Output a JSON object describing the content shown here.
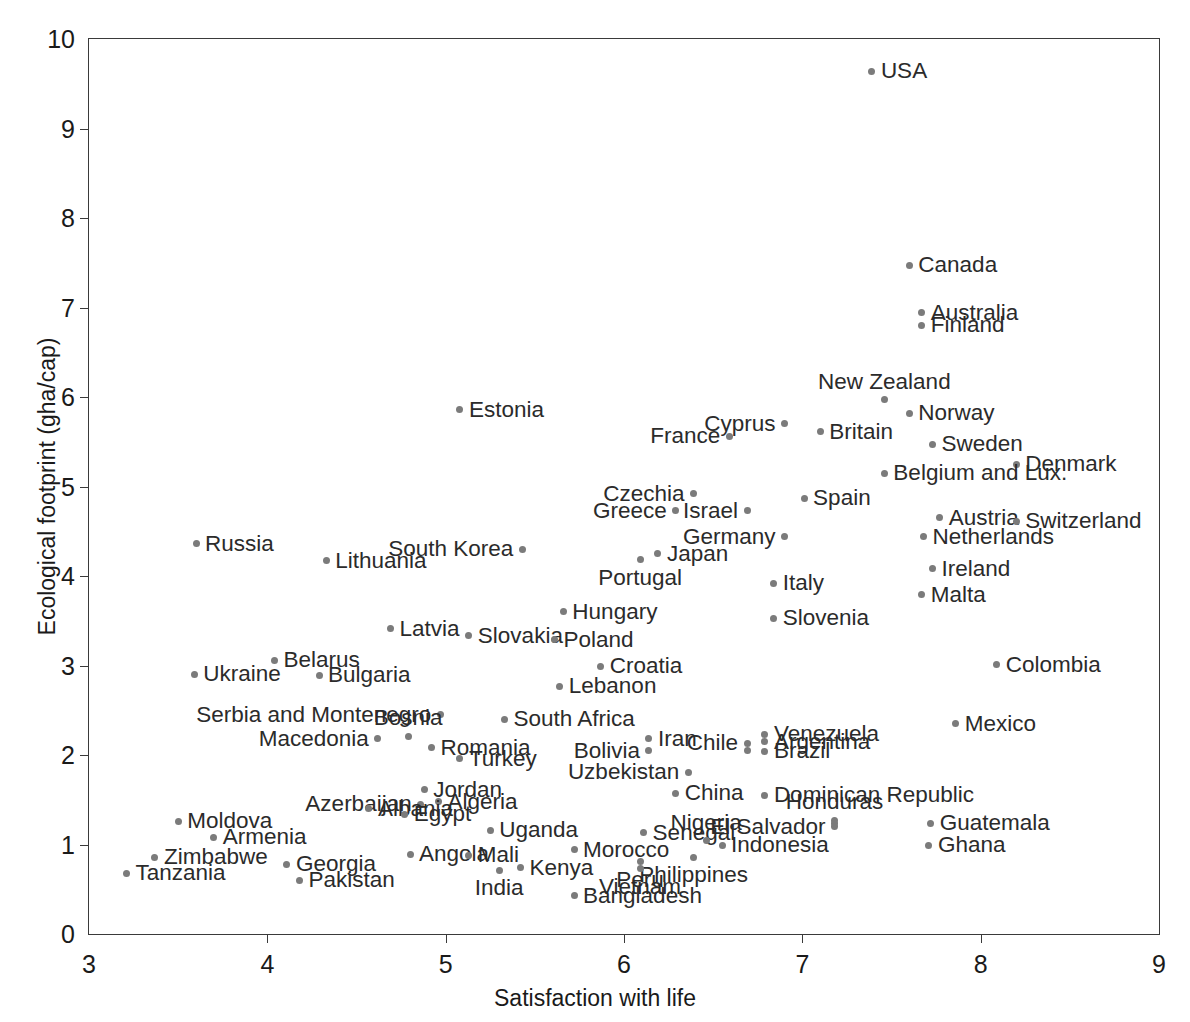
{
  "chart_data": {
    "type": "scatter",
    "title": "",
    "xlabel": "Satisfaction with life",
    "ylabel": "Ecological footprint (gha/cap)",
    "xlim": [
      3,
      9
    ],
    "ylim": [
      0,
      10
    ],
    "xticks": [
      3,
      4,
      5,
      6,
      7,
      8,
      9
    ],
    "yticks": [
      0,
      1,
      2,
      3,
      4,
      5,
      6,
      7,
      8,
      9,
      10
    ],
    "grid": false,
    "legend": null,
    "point_color": "#7b7b7b",
    "axis_color": "#3a3a3a",
    "points": [
      {
        "label": "USA",
        "x": 7.39,
        "y": 9.64,
        "anchor": "right"
      },
      {
        "label": "Canada",
        "x": 7.6,
        "y": 7.47,
        "anchor": "right"
      },
      {
        "label": "Australia",
        "x": 7.67,
        "y": 6.94,
        "anchor": "right"
      },
      {
        "label": "Finland",
        "x": 7.67,
        "y": 6.8,
        "anchor": "right"
      },
      {
        "label": "New Zealand",
        "x": 7.46,
        "y": 5.97,
        "anchor": "above"
      },
      {
        "label": "Estonia",
        "x": 5.08,
        "y": 5.86,
        "anchor": "right"
      },
      {
        "label": "Norway",
        "x": 7.6,
        "y": 5.82,
        "anchor": "right"
      },
      {
        "label": "Cyprus",
        "x": 6.9,
        "y": 5.7,
        "anchor": "left"
      },
      {
        "label": "Britain",
        "x": 7.1,
        "y": 5.61,
        "anchor": "right"
      },
      {
        "label": "France",
        "x": 6.59,
        "y": 5.56,
        "anchor": "left"
      },
      {
        "label": "Sweden",
        "x": 7.73,
        "y": 5.47,
        "anchor": "right"
      },
      {
        "label": "Denmark",
        "x": 8.2,
        "y": 5.25,
        "anchor": "right"
      },
      {
        "label": "Belgium and Lux.",
        "x": 7.46,
        "y": 5.15,
        "anchor": "right"
      },
      {
        "label": "Czechia",
        "x": 6.39,
        "y": 4.92,
        "anchor": "left"
      },
      {
        "label": "Spain",
        "x": 7.01,
        "y": 4.87,
        "anchor": "right"
      },
      {
        "label": "Israel",
        "x": 6.69,
        "y": 4.73,
        "anchor": "left"
      },
      {
        "label": "Greece",
        "x": 6.29,
        "y": 4.73,
        "anchor": "left"
      },
      {
        "label": "Austria",
        "x": 7.77,
        "y": 4.65,
        "anchor": "right"
      },
      {
        "label": "Switzerland",
        "x": 8.2,
        "y": 4.61,
        "anchor": "right"
      },
      {
        "label": "Germany",
        "x": 6.9,
        "y": 4.44,
        "anchor": "left"
      },
      {
        "label": "Netherlands",
        "x": 7.68,
        "y": 4.44,
        "anchor": "right"
      },
      {
        "label": "Russia",
        "x": 3.6,
        "y": 4.36,
        "anchor": "right"
      },
      {
        "label": "South Korea",
        "x": 5.43,
        "y": 4.3,
        "anchor": "left"
      },
      {
        "label": "Japan",
        "x": 6.19,
        "y": 4.25,
        "anchor": "right"
      },
      {
        "label": "Portugal",
        "x": 6.09,
        "y": 4.18,
        "anchor": "below"
      },
      {
        "label": "Lithuania",
        "x": 4.33,
        "y": 4.17,
        "anchor": "right"
      },
      {
        "label": "Ireland",
        "x": 7.73,
        "y": 4.08,
        "anchor": "right"
      },
      {
        "label": "Italy",
        "x": 6.84,
        "y": 3.92,
        "anchor": "right"
      },
      {
        "label": "Malta",
        "x": 7.67,
        "y": 3.79,
        "anchor": "right"
      },
      {
        "label": "Hungary",
        "x": 5.66,
        "y": 3.6,
        "anchor": "right"
      },
      {
        "label": "Slovenia",
        "x": 6.84,
        "y": 3.53,
        "anchor": "right"
      },
      {
        "label": "Latvia",
        "x": 4.69,
        "y": 3.41,
        "anchor": "right"
      },
      {
        "label": "Slovakia",
        "x": 5.13,
        "y": 3.33,
        "anchor": "right"
      },
      {
        "label": "Poland",
        "x": 5.61,
        "y": 3.29,
        "anchor": "right"
      },
      {
        "label": "Belarus",
        "x": 4.04,
        "y": 3.06,
        "anchor": "right"
      },
      {
        "label": "Colombia",
        "x": 8.09,
        "y": 3.01,
        "anchor": "right"
      },
      {
        "label": "Croatia",
        "x": 5.87,
        "y": 2.99,
        "anchor": "right"
      },
      {
        "label": "Ukraine",
        "x": 3.59,
        "y": 2.9,
        "anchor": "right"
      },
      {
        "label": "Bulgaria",
        "x": 4.29,
        "y": 2.89,
        "anchor": "right"
      },
      {
        "label": "Lebanon",
        "x": 5.64,
        "y": 2.77,
        "anchor": "right"
      },
      {
        "label": "Serbia and Montenegro",
        "x": 4.97,
        "y": 2.45,
        "anchor": "left"
      },
      {
        "label": "South Africa",
        "x": 5.33,
        "y": 2.4,
        "anchor": "right"
      },
      {
        "label": "Mexico",
        "x": 7.86,
        "y": 2.35,
        "anchor": "right"
      },
      {
        "label": "Venezuela",
        "x": 6.79,
        "y": 2.23,
        "anchor": "right"
      },
      {
        "label": "Bosnia",
        "x": 4.79,
        "y": 2.21,
        "anchor": "above"
      },
      {
        "label": "Iran",
        "x": 6.14,
        "y": 2.18,
        "anchor": "right"
      },
      {
        "label": "Macedonia",
        "x": 4.62,
        "y": 2.18,
        "anchor": "left"
      },
      {
        "label": "Argentina",
        "x": 6.79,
        "y": 2.15,
        "anchor": "right"
      },
      {
        "label": "Chile",
        "x": 6.69,
        "y": 2.13,
        "anchor": "left"
      },
      {
        "label": "Romania",
        "x": 4.92,
        "y": 2.08,
        "anchor": "right"
      },
      {
        "label": "Bolivia",
        "x": 6.14,
        "y": 2.05,
        "anchor": "left"
      },
      {
        "label": "Brazil",
        "x": 6.79,
        "y": 2.04,
        "anchor": "right"
      },
      {
        "label": "Turkey",
        "x": 5.08,
        "y": 1.96,
        "anchor": "right"
      },
      {
        "label": "Uzbekistan",
        "x": 6.36,
        "y": 1.81,
        "anchor": "left"
      },
      {
        "label": "Jordan",
        "x": 4.88,
        "y": 1.61,
        "anchor": "right"
      },
      {
        "label": "China",
        "x": 6.29,
        "y": 1.57,
        "anchor": "right"
      },
      {
        "label": "Dominican Republic",
        "x": 6.79,
        "y": 1.55,
        "anchor": "right"
      },
      {
        "label": "Algeria",
        "x": 4.96,
        "y": 1.48,
        "anchor": "right"
      },
      {
        "label": "Azerbaijan",
        "x": 4.86,
        "y": 1.45,
        "anchor": "left"
      },
      {
        "label": "Albania",
        "x": 4.57,
        "y": 1.4,
        "anchor": "right"
      },
      {
        "label": "Egypt",
        "x": 4.77,
        "y": 1.34,
        "anchor": "right"
      },
      {
        "label": "Honduras",
        "x": 7.18,
        "y": 1.27,
        "anchor": "above"
      },
      {
        "label": "Moldova",
        "x": 3.5,
        "y": 1.26,
        "anchor": "right"
      },
      {
        "label": "Guatemala",
        "x": 7.72,
        "y": 1.24,
        "anchor": "right"
      },
      {
        "label": "El Salvador",
        "x": 7.18,
        "y": 1.2,
        "anchor": "left"
      },
      {
        "label": "Uganda",
        "x": 5.25,
        "y": 1.16,
        "anchor": "right"
      },
      {
        "label": "Senegal",
        "x": 6.11,
        "y": 1.13,
        "anchor": "right"
      },
      {
        "label": "Armenia",
        "x": 3.7,
        "y": 1.08,
        "anchor": "right"
      },
      {
        "label": "Nigeria",
        "x": 6.46,
        "y": 1.04,
        "anchor": "above"
      },
      {
        "label": "Indonesia",
        "x": 6.55,
        "y": 0.99,
        "anchor": "right"
      },
      {
        "label": "Ghana",
        "x": 7.71,
        "y": 0.99,
        "anchor": "right"
      },
      {
        "label": "Morocco",
        "x": 5.72,
        "y": 0.94,
        "anchor": "right"
      },
      {
        "label": "Angola",
        "x": 4.8,
        "y": 0.89,
        "anchor": "right"
      },
      {
        "label": "Mali",
        "x": 5.13,
        "y": 0.88,
        "anchor": "right"
      },
      {
        "label": "Philippines",
        "x": 6.39,
        "y": 0.86,
        "anchor": "below"
      },
      {
        "label": "Zimbabwe",
        "x": 3.37,
        "y": 0.86,
        "anchor": "right"
      },
      {
        "label": "Peru",
        "x": 6.09,
        "y": 0.81,
        "anchor": "below"
      },
      {
        "label": "Georgia",
        "x": 4.11,
        "y": 0.78,
        "anchor": "right"
      },
      {
        "label": "Kenya",
        "x": 5.42,
        "y": 0.74,
        "anchor": "right"
      },
      {
        "label": "Vietnam",
        "x": 6.09,
        "y": 0.73,
        "anchor": "below"
      },
      {
        "label": "India",
        "x": 5.3,
        "y": 0.71,
        "anchor": "below"
      },
      {
        "label": "Tanzania",
        "x": 3.21,
        "y": 0.68,
        "anchor": "right"
      },
      {
        "label": "Pakistan",
        "x": 4.18,
        "y": 0.6,
        "anchor": "right"
      },
      {
        "label": "Bangladesh",
        "x": 5.72,
        "y": 0.43,
        "anchor": "right"
      }
    ],
    "extra_points": [
      {
        "x": 6.69,
        "y": 2.05
      },
      {
        "x": 7.18,
        "y": 1.23
      }
    ]
  }
}
